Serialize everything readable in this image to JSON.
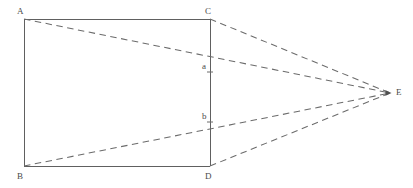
{
  "figure": {
    "type": "geometry-perspective-diagram",
    "background_color": "#ffffff",
    "stroke_color": "#606060",
    "dash_color": "#6b6b6b",
    "label_color": "#4a4a4a",
    "width": 413,
    "height": 188
  },
  "points": {
    "A": {
      "label": "A",
      "x": 24,
      "y": 19,
      "label_x": 17,
      "label_y": 7
    },
    "B": {
      "label": "B",
      "x": 24,
      "y": 166,
      "label_x": 17,
      "label_y": 172
    },
    "C": {
      "label": "C",
      "x": 210,
      "y": 19,
      "label_x": 205,
      "label_y": 7
    },
    "D": {
      "label": "D",
      "x": 210,
      "y": 166,
      "label_x": 205,
      "label_y": 172
    },
    "E": {
      "label": "E",
      "x": 390,
      "y": 93,
      "label_x": 396,
      "label_y": 88
    },
    "a": {
      "label": "a",
      "x": 210,
      "y": 72,
      "label_x": 202,
      "label_y": 62
    },
    "b": {
      "label": "b",
      "x": 210,
      "y": 122,
      "label_x": 202,
      "label_y": 112
    }
  },
  "shapes": {
    "rectangle": {
      "name": "rectangle-abdc",
      "vertices": [
        "A",
        "C",
        "D",
        "B"
      ],
      "style": "solid",
      "stroke_width": 1
    }
  },
  "dashed_lines": [
    {
      "name": "line-a-to-e",
      "from": "A",
      "to": "E",
      "style": "dashed"
    },
    {
      "name": "line-c-to-e",
      "from": "C",
      "to": "E",
      "style": "dashed"
    },
    {
      "name": "line-b-to-e",
      "from": "B",
      "to": "E",
      "style": "dashed"
    },
    {
      "name": "line-d-to-e",
      "from": "D",
      "to": "E",
      "style": "dashed"
    }
  ],
  "markers": {
    "e_arrow": {
      "name": "arrow-marker-e",
      "visible": true
    }
  },
  "labels_order": [
    "A",
    "C",
    "a",
    "b",
    "E",
    "B",
    "D"
  ]
}
